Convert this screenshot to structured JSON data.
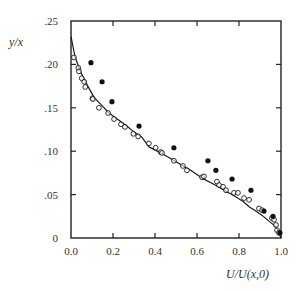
{
  "chart_data": {
    "type": "scatter",
    "title": "",
    "xlabel": "U/U(x,0)",
    "ylabel": "y/x",
    "xlim": [
      0.0,
      1.0
    ],
    "ylim": [
      0.0,
      0.25
    ],
    "grid": false,
    "legend": null,
    "x_ticks": [
      0.0,
      0.2,
      0.4,
      0.6,
      0.8,
      1.0
    ],
    "x_tick_labels": [
      "0.0",
      "0.2",
      "0.4",
      "0.6",
      "0.8",
      "1.0"
    ],
    "y_ticks": [
      0,
      0.05,
      0.1,
      0.15,
      0.2,
      0.25
    ],
    "y_tick_labels": [
      "0",
      ".05",
      ".10",
      ".15",
      ".20",
      ".25"
    ],
    "series": [
      {
        "name": "theory curve",
        "style": "line",
        "color": "#1a1a1a",
        "x": [
          0.0,
          0.02,
          0.048,
          0.08,
          0.11,
          0.15,
          0.181,
          0.22,
          0.262,
          0.3,
          0.338,
          0.371,
          0.42,
          0.47,
          0.52,
          0.57,
          0.624,
          0.68,
          0.73,
          0.78,
          0.82,
          0.848,
          0.88,
          0.91,
          0.94,
          0.96,
          0.976,
          0.99,
          1.0
        ],
        "y": [
          0.232,
          0.208,
          0.19,
          0.175,
          0.162,
          0.152,
          0.144,
          0.137,
          0.13,
          0.122,
          0.116,
          0.105,
          0.099,
          0.092,
          0.085,
          0.078,
          0.069,
          0.062,
          0.055,
          0.048,
          0.042,
          0.036,
          0.031,
          0.026,
          0.02,
          0.016,
          0.013,
          0.006,
          0.0
        ]
      },
      {
        "name": "open circles",
        "style": "open-circle",
        "color": "#1a1a1a",
        "x": [
          0.014,
          0.035,
          0.038,
          0.051,
          0.063,
          0.068,
          0.102,
          0.104,
          0.133,
          0.177,
          0.205,
          0.238,
          0.257,
          0.297,
          0.32,
          0.371,
          0.403,
          0.427,
          0.433,
          0.49,
          0.533,
          0.552,
          0.624,
          0.633,
          0.695,
          0.705,
          0.724,
          0.738,
          0.776,
          0.795,
          0.824,
          0.848,
          0.895,
          0.91,
          0.957,
          0.967,
          0.976,
          0.981,
          0.99
        ],
        "y": [
          0.208,
          0.196,
          0.192,
          0.184,
          0.18,
          0.174,
          0.161,
          0.16,
          0.15,
          0.144,
          0.137,
          0.131,
          0.128,
          0.12,
          0.117,
          0.109,
          0.104,
          0.099,
          0.098,
          0.089,
          0.083,
          0.078,
          0.07,
          0.071,
          0.065,
          0.061,
          0.059,
          0.055,
          0.052,
          0.052,
          0.046,
          0.044,
          0.034,
          0.032,
          0.023,
          0.021,
          0.015,
          0.009,
          0.006
        ]
      },
      {
        "name": "filled circles",
        "style": "filled-circle",
        "color": "#111111",
        "x": [
          0.095,
          0.148,
          0.195,
          0.324,
          0.49,
          0.652,
          0.69,
          0.767,
          0.857,
          0.919,
          0.962,
          0.995
        ],
        "y": [
          0.202,
          0.18,
          0.157,
          0.129,
          0.104,
          0.089,
          0.078,
          0.068,
          0.055,
          0.031,
          0.025,
          0.006
        ]
      }
    ]
  },
  "layout": {
    "plot_left": 71,
    "plot_right": 281,
    "plot_top": 21,
    "plot_bottom": 238
  }
}
